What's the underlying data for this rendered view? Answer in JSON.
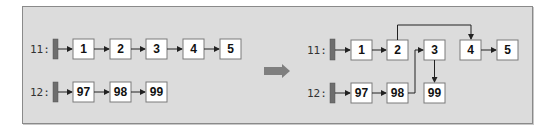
{
  "diagram": {
    "type": "linked-list-splice",
    "colors": {
      "panel_background": "#dcdcdc",
      "panel_border": "#8a8a8a",
      "node_fill": "#ffffff",
      "node_border": "#7a7a7a",
      "head_bar": "#6e6e6e",
      "transition_arrow": "#7f7f7f"
    },
    "before": {
      "lists": [
        {
          "label": "11:",
          "nodes": [
            "1",
            "2",
            "3",
            "4",
            "5"
          ]
        },
        {
          "label": "12:",
          "nodes": [
            "97",
            "98",
            "99"
          ]
        }
      ]
    },
    "transition_icon": "right-arrow-icon",
    "after": {
      "lists": [
        {
          "label": "11:",
          "nodes": [
            "1",
            "2",
            "3",
            "4",
            "5"
          ]
        },
        {
          "label": "12:",
          "nodes": [
            "97",
            "98",
            "99"
          ]
        }
      ],
      "edges": [
        {
          "from": "head-11",
          "to": "1"
        },
        {
          "from": "1",
          "to": "2"
        },
        {
          "from": "2",
          "to": "4",
          "routing": "over-top"
        },
        {
          "from": "4",
          "to": "5"
        },
        {
          "from": "head-12",
          "to": "97"
        },
        {
          "from": "97",
          "to": "98"
        },
        {
          "from": "98",
          "to": "3",
          "routing": "up-right"
        },
        {
          "from": "3",
          "to": "99",
          "routing": "down"
        }
      ]
    }
  }
}
